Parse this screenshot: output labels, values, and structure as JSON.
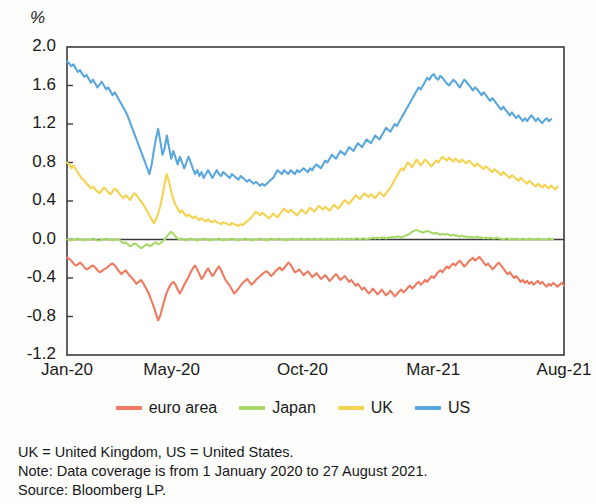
{
  "chart_data": {
    "type": "line",
    "title": "",
    "subtitle": "",
    "xlabel": "",
    "ylabel": "%",
    "ylim": [
      -1.2,
      2.0
    ],
    "yticks": [
      "2.0",
      "1.6",
      "1.2",
      "0.8",
      "0.4",
      "0.0",
      "-0.4",
      "-0.8",
      "-1.2"
    ],
    "ytick_values": [
      2.0,
      1.6,
      1.2,
      0.8,
      0.4,
      0.0,
      -0.4,
      -0.8,
      -1.2
    ],
    "xticks": [
      "Jan-20",
      "May-20",
      "Oct-20",
      "Mar-21",
      "Aug-21"
    ],
    "xtick_positions": [
      0,
      0.2105,
      0.4737,
      0.7368,
      1.0
    ],
    "grid": false,
    "zero_line": true,
    "legend_position": "bottom",
    "series": [
      {
        "name": "euro area",
        "color": "#f07a5f",
        "values": [
          -0.19,
          -0.2,
          -0.22,
          -0.25,
          -0.27,
          -0.26,
          -0.24,
          -0.26,
          -0.29,
          -0.31,
          -0.3,
          -0.28,
          -0.27,
          -0.29,
          -0.32,
          -0.34,
          -0.33,
          -0.31,
          -0.3,
          -0.28,
          -0.26,
          -0.25,
          -0.27,
          -0.3,
          -0.33,
          -0.36,
          -0.34,
          -0.32,
          -0.35,
          -0.38,
          -0.4,
          -0.43,
          -0.46,
          -0.44,
          -0.42,
          -0.45,
          -0.49,
          -0.53,
          -0.58,
          -0.64,
          -0.7,
          -0.77,
          -0.84,
          -0.79,
          -0.7,
          -0.62,
          -0.55,
          -0.5,
          -0.46,
          -0.44,
          -0.47,
          -0.52,
          -0.56,
          -0.52,
          -0.47,
          -0.43,
          -0.39,
          -0.34,
          -0.3,
          -0.27,
          -0.31,
          -0.36,
          -0.41,
          -0.38,
          -0.33,
          -0.3,
          -0.34,
          -0.38,
          -0.35,
          -0.31,
          -0.28,
          -0.32,
          -0.37,
          -0.42,
          -0.45,
          -0.48,
          -0.52,
          -0.56,
          -0.54,
          -0.51,
          -0.48,
          -0.45,
          -0.43,
          -0.41,
          -0.44,
          -0.47,
          -0.45,
          -0.42,
          -0.4,
          -0.38,
          -0.36,
          -0.34,
          -0.33,
          -0.35,
          -0.38,
          -0.36,
          -0.33,
          -0.31,
          -0.29,
          -0.32,
          -0.3,
          -0.27,
          -0.24,
          -0.26,
          -0.3,
          -0.34,
          -0.33,
          -0.31,
          -0.34,
          -0.37,
          -0.35,
          -0.33,
          -0.36,
          -0.39,
          -0.37,
          -0.35,
          -0.38,
          -0.41,
          -0.39,
          -0.37,
          -0.4,
          -0.43,
          -0.41,
          -0.38,
          -0.36,
          -0.39,
          -0.42,
          -0.4,
          -0.38,
          -0.41,
          -0.44,
          -0.42,
          -0.45,
          -0.48,
          -0.46,
          -0.49,
          -0.52,
          -0.5,
          -0.53,
          -0.56,
          -0.54,
          -0.51,
          -0.54,
          -0.57,
          -0.55,
          -0.52,
          -0.55,
          -0.58,
          -0.56,
          -0.53,
          -0.56,
          -0.59,
          -0.57,
          -0.54,
          -0.52,
          -0.55,
          -0.53,
          -0.5,
          -0.48,
          -0.51,
          -0.49,
          -0.46,
          -0.44,
          -0.47,
          -0.45,
          -0.42,
          -0.44,
          -0.41,
          -0.38,
          -0.4,
          -0.37,
          -0.34,
          -0.32,
          -0.34,
          -0.31,
          -0.28,
          -0.3,
          -0.27,
          -0.25,
          -0.27,
          -0.24,
          -0.22,
          -0.25,
          -0.28,
          -0.26,
          -0.23,
          -0.21,
          -0.19,
          -0.22,
          -0.2,
          -0.18,
          -0.21,
          -0.24,
          -0.27,
          -0.25,
          -0.28,
          -0.31,
          -0.29,
          -0.26,
          -0.24,
          -0.27,
          -0.3,
          -0.33,
          -0.36,
          -0.34,
          -0.37,
          -0.4,
          -0.38,
          -0.41,
          -0.44,
          -0.42,
          -0.45,
          -0.43,
          -0.46,
          -0.44,
          -0.47,
          -0.45,
          -0.43,
          -0.46,
          -0.44,
          -0.47,
          -0.49,
          -0.46,
          -0.48,
          -0.45,
          -0.47,
          -0.49,
          -0.47,
          -0.45,
          -0.48
        ]
      },
      {
        "name": "Japan",
        "color": "#a8d96a",
        "values": [
          0.0,
          0.0,
          -0.01,
          0.0,
          0.0,
          0.01,
          0.0,
          0.0,
          -0.01,
          0.0,
          0.0,
          0.0,
          0.01,
          0.0,
          -0.01,
          -0.01,
          0.0,
          0.0,
          0.01,
          0.0,
          0.0,
          -0.01,
          0.0,
          0.0,
          0.0,
          -0.02,
          -0.04,
          -0.03,
          -0.05,
          -0.07,
          -0.06,
          -0.04,
          -0.05,
          -0.07,
          -0.09,
          -0.08,
          -0.06,
          -0.05,
          -0.07,
          -0.06,
          -0.04,
          -0.03,
          -0.05,
          -0.04,
          -0.02,
          0.0,
          0.03,
          0.06,
          0.08,
          0.06,
          0.03,
          0.01,
          0.0,
          0.01,
          0.0,
          -0.01,
          0.0,
          0.01,
          0.0,
          0.0,
          -0.01,
          0.0,
          0.0,
          0.01,
          0.0,
          0.0,
          -0.01,
          0.0,
          0.0,
          0.0,
          0.01,
          0.0,
          -0.01,
          0.0,
          0.0,
          0.0,
          0.01,
          0.0,
          0.0,
          -0.01,
          0.0,
          0.0,
          0.01,
          0.0,
          0.0,
          -0.01,
          0.0,
          0.0,
          0.0,
          0.01,
          0.0,
          0.0,
          -0.01,
          0.0,
          0.01,
          0.0,
          0.0,
          0.0,
          0.01,
          0.0,
          0.0,
          -0.01,
          0.0,
          0.0,
          0.01,
          0.0,
          0.0,
          0.0,
          0.01,
          0.0,
          0.0,
          0.01,
          0.0,
          0.0,
          0.01,
          0.0,
          0.0,
          0.01,
          0.0,
          0.0,
          0.01,
          0.0,
          0.01,
          0.0,
          0.0,
          0.01,
          0.0,
          0.01,
          0.0,
          0.01,
          0.0,
          0.01,
          0.0,
          0.01,
          0.01,
          0.0,
          0.01,
          0.01,
          0.0,
          0.01,
          0.01,
          0.02,
          0.01,
          0.02,
          0.01,
          0.02,
          0.02,
          0.01,
          0.02,
          0.02,
          0.03,
          0.02,
          0.03,
          0.03,
          0.02,
          0.03,
          0.04,
          0.05,
          0.06,
          0.08,
          0.09,
          0.1,
          0.09,
          0.08,
          0.07,
          0.08,
          0.09,
          0.08,
          0.07,
          0.06,
          0.07,
          0.06,
          0.05,
          0.06,
          0.05,
          0.06,
          0.05,
          0.04,
          0.05,
          0.04,
          0.04,
          0.03,
          0.04,
          0.03,
          0.03,
          0.02,
          0.03,
          0.02,
          0.02,
          0.03,
          0.02,
          0.02,
          0.01,
          0.02,
          0.01,
          0.02,
          0.01,
          0.01,
          0.02,
          0.01,
          0.01,
          0.0,
          0.01,
          0.01,
          0.0,
          0.01,
          0.0,
          0.01,
          0.0,
          0.0,
          0.01,
          0.0,
          0.0,
          0.01,
          0.0,
          0.0,
          0.0,
          0.01,
          0.0,
          0.0,
          0.0,
          0.0,
          0.01,
          0.0,
          0.0
        ]
      },
      {
        "name": "UK",
        "color": "#f5d24f",
        "values": [
          0.8,
          0.78,
          0.74,
          0.77,
          0.73,
          0.69,
          0.66,
          0.63,
          0.61,
          0.58,
          0.56,
          0.53,
          0.55,
          0.52,
          0.5,
          0.48,
          0.51,
          0.54,
          0.52,
          0.49,
          0.47,
          0.5,
          0.53,
          0.51,
          0.48,
          0.45,
          0.43,
          0.46,
          0.44,
          0.41,
          0.45,
          0.48,
          0.46,
          0.43,
          0.4,
          0.37,
          0.33,
          0.29,
          0.25,
          0.21,
          0.17,
          0.21,
          0.27,
          0.35,
          0.46,
          0.58,
          0.68,
          0.6,
          0.5,
          0.42,
          0.36,
          0.32,
          0.28,
          0.3,
          0.27,
          0.24,
          0.26,
          0.24,
          0.22,
          0.24,
          0.22,
          0.2,
          0.22,
          0.2,
          0.19,
          0.21,
          0.19,
          0.18,
          0.2,
          0.18,
          0.17,
          0.16,
          0.18,
          0.17,
          0.16,
          0.15,
          0.17,
          0.16,
          0.15,
          0.14,
          0.16,
          0.15,
          0.17,
          0.19,
          0.21,
          0.23,
          0.26,
          0.29,
          0.27,
          0.25,
          0.28,
          0.26,
          0.24,
          0.22,
          0.24,
          0.27,
          0.25,
          0.23,
          0.26,
          0.29,
          0.32,
          0.3,
          0.28,
          0.31,
          0.29,
          0.27,
          0.25,
          0.28,
          0.31,
          0.29,
          0.27,
          0.3,
          0.33,
          0.31,
          0.29,
          0.32,
          0.35,
          0.33,
          0.31,
          0.34,
          0.32,
          0.3,
          0.33,
          0.36,
          0.34,
          0.32,
          0.35,
          0.38,
          0.41,
          0.39,
          0.37,
          0.4,
          0.43,
          0.46,
          0.44,
          0.42,
          0.45,
          0.48,
          0.46,
          0.44,
          0.47,
          0.45,
          0.43,
          0.46,
          0.49,
          0.47,
          0.45,
          0.48,
          0.51,
          0.54,
          0.58,
          0.62,
          0.66,
          0.7,
          0.74,
          0.72,
          0.76,
          0.8,
          0.78,
          0.75,
          0.79,
          0.83,
          0.8,
          0.77,
          0.8,
          0.83,
          0.81,
          0.78,
          0.76,
          0.79,
          0.82,
          0.8,
          0.83,
          0.86,
          0.84,
          0.82,
          0.85,
          0.83,
          0.81,
          0.84,
          0.82,
          0.8,
          0.83,
          0.81,
          0.79,
          0.82,
          0.8,
          0.78,
          0.76,
          0.79,
          0.77,
          0.75,
          0.73,
          0.76,
          0.74,
          0.72,
          0.7,
          0.73,
          0.71,
          0.69,
          0.67,
          0.7,
          0.68,
          0.66,
          0.64,
          0.67,
          0.65,
          0.63,
          0.61,
          0.64,
          0.62,
          0.6,
          0.58,
          0.61,
          0.59,
          0.57,
          0.55,
          0.58,
          0.56,
          0.54,
          0.57,
          0.55,
          0.53,
          0.56,
          0.54,
          0.52,
          0.55
        ]
      },
      {
        "name": "US",
        "color": "#5aa7dd",
        "values": [
          1.85,
          1.83,
          1.8,
          1.82,
          1.78,
          1.74,
          1.76,
          1.72,
          1.69,
          1.71,
          1.67,
          1.63,
          1.66,
          1.62,
          1.58,
          1.61,
          1.64,
          1.6,
          1.56,
          1.58,
          1.54,
          1.5,
          1.53,
          1.49,
          1.45,
          1.41,
          1.37,
          1.33,
          1.28,
          1.22,
          1.16,
          1.1,
          1.04,
          0.98,
          0.92,
          0.86,
          0.8,
          0.74,
          0.68,
          0.78,
          0.92,
          1.05,
          1.15,
          1.02,
          0.88,
          0.95,
          1.08,
          0.96,
          0.84,
          0.92,
          0.85,
          0.78,
          0.86,
          0.8,
          0.74,
          0.8,
          0.86,
          0.8,
          0.74,
          0.68,
          0.72,
          0.66,
          0.7,
          0.64,
          0.68,
          0.72,
          0.68,
          0.64,
          0.68,
          0.72,
          0.68,
          0.66,
          0.7,
          0.68,
          0.66,
          0.64,
          0.68,
          0.66,
          0.64,
          0.62,
          0.66,
          0.64,
          0.62,
          0.6,
          0.62,
          0.6,
          0.58,
          0.6,
          0.58,
          0.56,
          0.58,
          0.56,
          0.58,
          0.6,
          0.62,
          0.64,
          0.68,
          0.72,
          0.7,
          0.68,
          0.72,
          0.7,
          0.68,
          0.72,
          0.7,
          0.68,
          0.72,
          0.7,
          0.72,
          0.74,
          0.72,
          0.7,
          0.74,
          0.72,
          0.76,
          0.78,
          0.76,
          0.74,
          0.78,
          0.82,
          0.8,
          0.84,
          0.88,
          0.86,
          0.84,
          0.88,
          0.92,
          0.9,
          0.88,
          0.92,
          0.96,
          0.94,
          0.92,
          0.96,
          1.0,
          0.98,
          0.96,
          1.0,
          1.04,
          1.02,
          1.0,
          1.04,
          1.08,
          1.06,
          1.04,
          1.08,
          1.12,
          1.16,
          1.14,
          1.12,
          1.16,
          1.2,
          1.18,
          1.22,
          1.26,
          1.3,
          1.34,
          1.38,
          1.42,
          1.46,
          1.5,
          1.54,
          1.58,
          1.56,
          1.6,
          1.64,
          1.68,
          1.66,
          1.7,
          1.72,
          1.68,
          1.66,
          1.7,
          1.68,
          1.65,
          1.62,
          1.6,
          1.63,
          1.66,
          1.64,
          1.61,
          1.58,
          1.62,
          1.66,
          1.64,
          1.61,
          1.58,
          1.55,
          1.58,
          1.56,
          1.53,
          1.5,
          1.53,
          1.5,
          1.47,
          1.44,
          1.47,
          1.44,
          1.41,
          1.38,
          1.35,
          1.38,
          1.35,
          1.32,
          1.29,
          1.32,
          1.29,
          1.26,
          1.29,
          1.26,
          1.23,
          1.26,
          1.23,
          1.26,
          1.29,
          1.26,
          1.23,
          1.26,
          1.23,
          1.21,
          1.24,
          1.26,
          1.23,
          1.25
        ]
      }
    ]
  },
  "legend": {
    "items": [
      {
        "label": "euro area",
        "color": "#f07a5f"
      },
      {
        "label": "Japan",
        "color": "#a8d96a"
      },
      {
        "label": "UK",
        "color": "#f5d24f"
      },
      {
        "label": "US",
        "color": "#5aa7dd"
      }
    ]
  },
  "footnotes": {
    "line1": "UK = United Kingdom, US = United States.",
    "line2": "Note: Data coverage is from 1 January 2020 to 27 August 2021.",
    "line3": "Source: Bloomberg LP."
  }
}
